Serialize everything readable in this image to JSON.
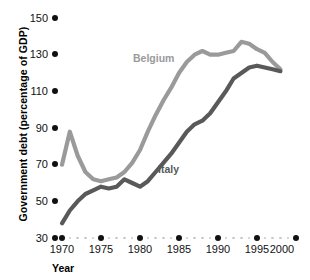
{
  "chart_data": {
    "type": "line",
    "title": "",
    "xlabel": "Year",
    "ylabel": "Government debt (percentage of GDP)",
    "xlim": [
      1969,
      2001
    ],
    "ylim": [
      30,
      150
    ],
    "yticks": [
      30,
      50,
      70,
      90,
      110,
      130,
      150
    ],
    "xticks": [
      1970,
      1975,
      1980,
      1985,
      1990,
      1995,
      2000
    ],
    "grid": false,
    "legend_position": "inline-annotations",
    "series": [
      {
        "name": "Belgium",
        "color": "#9a9a9a",
        "x": [
          1970,
          1971,
          1972,
          1973,
          1974,
          1975,
          1976,
          1977,
          1978,
          1979,
          1980,
          1981,
          1982,
          1983,
          1984,
          1985,
          1986,
          1987,
          1988,
          1989,
          1990,
          1991,
          1992,
          1993,
          1994,
          1995,
          1996,
          1997,
          1998
        ],
        "values": [
          70,
          88,
          75,
          66,
          62,
          61,
          62,
          63,
          66,
          71,
          78,
          88,
          97,
          105,
          112,
          120,
          126,
          130,
          132,
          130,
          130,
          131,
          132,
          137,
          136,
          133,
          131,
          126,
          122
        ]
      },
      {
        "name": "Italy",
        "color": "#595959",
        "x": [
          1970,
          1971,
          1972,
          1973,
          1974,
          1975,
          1976,
          1977,
          1978,
          1979,
          1980,
          1981,
          1982,
          1983,
          1984,
          1985,
          1986,
          1987,
          1988,
          1989,
          1990,
          1991,
          1992,
          1993,
          1994,
          1995,
          1996,
          1997,
          1998
        ],
        "values": [
          38,
          45,
          50,
          54,
          56,
          58,
          57,
          58,
          62,
          60,
          58,
          61,
          66,
          71,
          76,
          82,
          88,
          92,
          94,
          98,
          104,
          110,
          117,
          120,
          123,
          124,
          123,
          122,
          121
        ]
      }
    ],
    "annotations": [
      {
        "text": "Belgium",
        "x": 1983,
        "y": 121,
        "color": "#9a9a9a"
      },
      {
        "text": "Italy",
        "x": 1987,
        "y": 76,
        "color": "#595959"
      }
    ]
  },
  "axis": {
    "y_title": "Government debt (percentage of GDP)",
    "x_title": "Year",
    "y_tick_labels": [
      "150",
      "130",
      "110",
      "90",
      "70",
      "50",
      "30"
    ],
    "x_tick_labels": [
      "1970",
      "1975",
      "1980",
      "1985",
      "1990",
      "1995",
      "2000"
    ]
  },
  "colors": {
    "belgium": "#9a9a9a",
    "italy": "#595959",
    "tick": "#111111",
    "minor_tick": "#c9c9c9",
    "background": "#ffffff"
  }
}
